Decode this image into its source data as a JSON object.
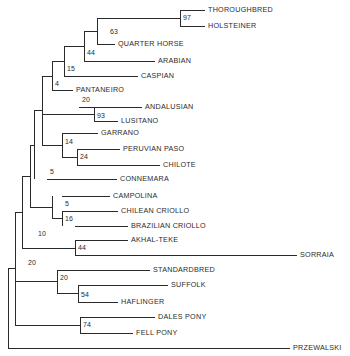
{
  "figure": {
    "type": "phylogenetic-tree",
    "orientation": "left-to-right",
    "width": 350,
    "height": 356,
    "line_color": "#2b2b2b",
    "background_color": "#ffffff"
  },
  "chart_data": {
    "type": "tree",
    "title": "",
    "xlabel": "",
    "ylabel": "",
    "leaf_count": 21,
    "leaves": [
      {
        "name": "THOROUGHBRED",
        "tip_x": 205,
        "y": 10,
        "branch_x": 180
      },
      {
        "name": "HOLSTEINER",
        "tip_x": 205,
        "y": 26,
        "branch_x": 180
      },
      {
        "name": "QUARTER HORSE",
        "tip_x": 115,
        "y": 44,
        "branch_x": 97
      },
      {
        "name": "ARABIAN",
        "tip_x": 155,
        "y": 61,
        "branch_x": 84
      },
      {
        "name": "CASPIAN",
        "tip_x": 138,
        "y": 76,
        "branch_x": 64
      },
      {
        "name": "PANTANEIRO",
        "tip_x": 73,
        "y": 90,
        "branch_x": 52
      },
      {
        "name": "ANDALUSIAN",
        "tip_x": 142,
        "y": 107,
        "branch_x": 79
      },
      {
        "name": "LUSITANO",
        "tip_x": 118,
        "y": 121,
        "branch_x": 94
      },
      {
        "name": "GARRANO",
        "tip_x": 98,
        "y": 133,
        "branch_x": 62
      },
      {
        "name": "PERUVIAN PASO",
        "tip_x": 120,
        "y": 149,
        "branch_x": 77
      },
      {
        "name": "CHILOTE",
        "tip_x": 160,
        "y": 165,
        "branch_x": 77
      },
      {
        "name": "CONNEMARA",
        "tip_x": 117,
        "y": 179,
        "branch_x": 47
      },
      {
        "name": "CAMPOLINA",
        "tip_x": 110,
        "y": 196,
        "branch_x": 62
      },
      {
        "name": "CHILEAN CRIOLLO",
        "tip_x": 118,
        "y": 211,
        "branch_x": 62
      },
      {
        "name": "BRAZILIAN CRIOLLO",
        "tip_x": 128,
        "y": 226,
        "branch_x": 75
      },
      {
        "name": "AKHAL-TEKE",
        "tip_x": 128,
        "y": 240,
        "branch_x": 75
      },
      {
        "name": "SORRAIA",
        "tip_x": 297,
        "y": 255,
        "branch_x": 75
      },
      {
        "name": "STANDARDBRED",
        "tip_x": 150,
        "y": 270,
        "branch_x": 57
      },
      {
        "name": "SUFFOLK",
        "tip_x": 168,
        "y": 285,
        "branch_x": 78
      },
      {
        "name": "HAFLINGER",
        "tip_x": 118,
        "y": 302,
        "branch_x": 78
      },
      {
        "name": "DALES PONY",
        "tip_x": 155,
        "y": 317,
        "branch_x": 80
      },
      {
        "name": "FELL PONY",
        "tip_x": 133,
        "y": 333,
        "branch_x": 80
      },
      {
        "name": "PRZEWALSKI",
        "tip_x": 290,
        "y": 348,
        "branch_x": 8
      }
    ],
    "bootstrap_values": [
      {
        "value": "97",
        "x": 183,
        "y": 14
      },
      {
        "value": "63",
        "x": 110,
        "y": 28
      },
      {
        "value": "44",
        "x": 87,
        "y": 49
      },
      {
        "value": "15",
        "x": 67,
        "y": 65
      },
      {
        "value": "4",
        "x": 55,
        "y": 80
      },
      {
        "value": "20",
        "x": 82,
        "y": 96
      },
      {
        "value": "93",
        "x": 97,
        "y": 112
      },
      {
        "value": "14",
        "x": 65,
        "y": 138
      },
      {
        "value": "24",
        "x": 80,
        "y": 153
      },
      {
        "value": "5",
        "x": 50,
        "y": 168
      },
      {
        "value": "5",
        "x": 65,
        "y": 200
      },
      {
        "value": "16",
        "x": 65,
        "y": 215
      },
      {
        "value": "10",
        "x": 38,
        "y": 230
      },
      {
        "value": "44",
        "x": 78,
        "y": 244
      },
      {
        "value": "20",
        "x": 28,
        "y": 259
      },
      {
        "value": "20",
        "x": 60,
        "y": 274
      },
      {
        "value": "54",
        "x": 81,
        "y": 291
      },
      {
        "value": "74",
        "x": 83,
        "y": 321
      }
    ],
    "internal_nodes": [
      {
        "name": "node-thoroughbred-holsteiner",
        "x": 180,
        "span_y": [
          10,
          26
        ],
        "parent_x": 97,
        "y": 18
      },
      {
        "name": "node-63",
        "x": 97,
        "span_y": [
          18,
          44
        ],
        "parent_x": 84,
        "y": 31
      },
      {
        "name": "node-44",
        "x": 84,
        "span_y": [
          31,
          61
        ],
        "parent_x": 64,
        "y": 46
      },
      {
        "name": "node-15",
        "x": 64,
        "span_y": [
          46,
          76
        ],
        "parent_x": 52,
        "y": 61
      },
      {
        "name": "node-4",
        "x": 52,
        "span_y": [
          61,
          90
        ],
        "parent_x": 42,
        "y": 76
      },
      {
        "name": "node-93",
        "x": 94,
        "span_y": [
          107,
          121
        ],
        "parent_x": 79,
        "y": 114
      },
      {
        "name": "node-20-iberian",
        "x": 79,
        "span_y": [
          114,
          114
        ],
        "parent_x": 42,
        "y": 114
      },
      {
        "name": "node-24",
        "x": 77,
        "span_y": [
          149,
          165
        ],
        "parent_x": 62,
        "y": 157
      },
      {
        "name": "node-14",
        "x": 62,
        "span_y": [
          133,
          157
        ],
        "parent_x": 42,
        "y": 145
      },
      {
        "name": "node-iberian-group",
        "x": 42,
        "span_y": [
          76,
          145
        ],
        "parent_x": 34,
        "y": 110
      },
      {
        "name": "node-5-connemara",
        "x": 34,
        "span_y": [
          110,
          179
        ],
        "parent_x": 30,
        "y": 145
      },
      {
        "name": "node-16",
        "x": 62,
        "span_y": [
          211,
          226
        ],
        "parent_x": 52,
        "y": 218
      },
      {
        "name": "node-5-campolina",
        "x": 52,
        "span_y": [
          196,
          218
        ],
        "parent_x": 30,
        "y": 207
      },
      {
        "name": "node-10",
        "x": 30,
        "span_y": [
          145,
          207
        ],
        "parent_x": 22,
        "y": 176
      },
      {
        "name": "node-44-sorraia",
        "x": 75,
        "span_y": [
          240,
          255
        ],
        "parent_x": 22,
        "y": 248
      },
      {
        "name": "node-20-akhal",
        "x": 22,
        "span_y": [
          176,
          248
        ],
        "parent_x": 15,
        "y": 212
      },
      {
        "name": "node-54",
        "x": 78,
        "span_y": [
          285,
          302
        ],
        "parent_x": 57,
        "y": 293
      },
      {
        "name": "node-20-standardbred",
        "x": 57,
        "span_y": [
          270,
          293
        ],
        "parent_x": 15,
        "y": 281
      },
      {
        "name": "node-74",
        "x": 80,
        "span_y": [
          317,
          333
        ],
        "parent_x": 15,
        "y": 325
      },
      {
        "name": "node-domestic",
        "x": 15,
        "span_y": [
          212,
          325
        ],
        "parent_x": 8,
        "y": 268
      },
      {
        "name": "node-root",
        "x": 8,
        "span_y": [
          268,
          348
        ],
        "parent_x": 8,
        "y": 308
      }
    ]
  }
}
